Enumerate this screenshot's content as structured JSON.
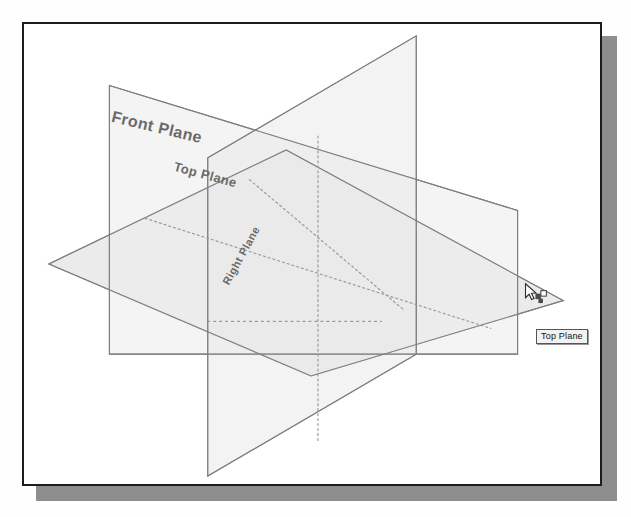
{
  "app": {
    "type": "cad-reference-geometry-view",
    "title": "Default planes view"
  },
  "figure": {
    "background_color": "#ffffff",
    "frame_border_color": "#1d1d1d",
    "frame_shadow_color": "#8e8e8e",
    "plane_fill_color": "#e6e6e6",
    "plane_edge_color": "#888888",
    "hidden_edge_color": "#9a9a9a"
  },
  "planes": [
    {
      "id": "front-plane",
      "label": "Front Plane",
      "orientation": "front",
      "fill": "#ededed",
      "edge": "#8c8c8c"
    },
    {
      "id": "top-plane",
      "label": "Top Plane",
      "orientation": "top",
      "fill": "#e4e4e4",
      "edge": "#8c8c8c"
    },
    {
      "id": "right-plane",
      "label": "Right Plane",
      "orientation": "right",
      "fill": "#eaeaea",
      "edge": "#8c8c8c"
    }
  ],
  "tooltip": {
    "text": "Top Plane",
    "visible": true
  },
  "cursor": {
    "type": "select-arrow-with-face-glyph",
    "x": 529,
    "y": 288
  }
}
